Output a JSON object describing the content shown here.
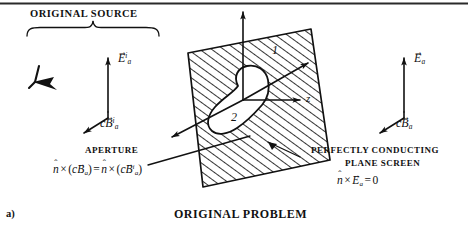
{
  "figure": {
    "panel_label": "a)",
    "caption": "ORIGINAL PROBLEM",
    "source_label": "ORIGINAL SOURCE",
    "aperture_label": "APERTURE",
    "screen_label_line1": "PERFECTLY CONDUCTING",
    "screen_label_line2": "PLANE SCREEN",
    "axis_label_z": "z",
    "region_label_1": "1",
    "region_label_2": "2",
    "ink_color": "#111111",
    "background_color": "#ffffff"
  },
  "fields": {
    "incident": {
      "e_symbol": "E",
      "e_arrow": "→",
      "e_subscript": "a",
      "e_superscript": "i",
      "b_prefix": "c",
      "b_symbol": "B",
      "b_arrow": "→",
      "b_subscript": "a",
      "b_superscript": "i"
    },
    "total": {
      "e_symbol": "E",
      "e_arrow": "→",
      "e_subscript": "a",
      "b_prefix": "c",
      "b_symbol": "B",
      "b_arrow": "→",
      "b_subscript": "a"
    }
  },
  "equations": {
    "aperture": {
      "n_hat": "n",
      "hat_glyph": "ˆ",
      "cross": "×",
      "lparen": "(",
      "rparen": ")",
      "c": "c",
      "b": "B",
      "b_arrow": "→",
      "sub": "a",
      "sup": "i",
      "equals": "="
    },
    "screen": {
      "n_hat": "n",
      "hat_glyph": "ˆ",
      "cross": "×",
      "e": "E",
      "e_arrow": "→",
      "sub": "a",
      "equals": "=",
      "zero": "0"
    }
  }
}
